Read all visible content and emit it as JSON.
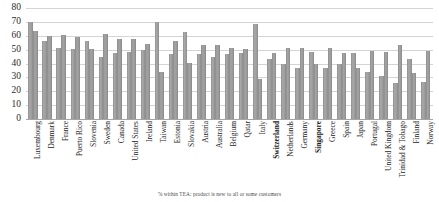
{
  "chart_data": {
    "type": "bar",
    "title": "",
    "xlabel": "",
    "ylabel": "",
    "ylim": [
      0,
      80
    ],
    "yticks": [
      0,
      10,
      20,
      30,
      40,
      50,
      60,
      70,
      80
    ],
    "grid": true,
    "legend": "none",
    "bar_color": "#9a9a9a",
    "categories": [
      "Luxembourg",
      "Denmark",
      "France",
      "Puerto Rico",
      "Slovenia",
      "Sweden",
      "Canada",
      "United States",
      "Ireland",
      "Taiwan",
      "Estonia",
      "Slovakia",
      "Austria",
      "Australia",
      "Belgium",
      "Qatar",
      "Italy",
      "Switzerland",
      "Netherlands",
      "Germany",
      "Singapore",
      "Greece",
      "Spain",
      "Japan",
      "Portugal",
      "United Kingdom",
      "Trinidad & Tobago",
      "Finland",
      "Norway"
    ],
    "highlighted_categories": [
      "Switzerland",
      "Singapore"
    ],
    "series": [
      {
        "name": "series-1",
        "values": [
          70,
          56.5,
          51,
          50.5,
          56.5,
          45,
          47.5,
          48,
          49.5,
          70,
          46.5,
          62.5,
          46.5,
          44.5,
          46.5,
          47.5,
          68.5,
          43,
          40,
          37,
          48.5,
          37,
          39.5,
          47.5,
          34,
          31,
          26,
          43,
          27
        ]
      },
      {
        "name": "series-2",
        "values": [
          63.5,
          60,
          60.5,
          59,
          50.5,
          61.5,
          58,
          57.5,
          54,
          34,
          56.5,
          40.5,
          53,
          53.5,
          51,
          50.5,
          28.5,
          47.5,
          51,
          51.5,
          40,
          51,
          47.5,
          36.5,
          49,
          48,
          53,
          33,
          49
        ]
      }
    ],
    "footnote": "% within TEA: product is new to all or some customers"
  }
}
